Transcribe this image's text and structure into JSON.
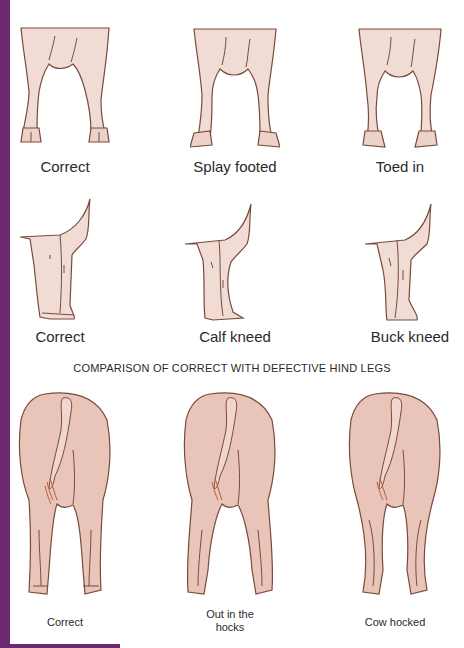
{
  "colors": {
    "accent_bar": "#6b2a70",
    "skin": "#f0dcd4",
    "rump": "#e9c5b9",
    "outline": "#7a4a3a"
  },
  "front_legs_front_view": [
    {
      "label": "Correct"
    },
    {
      "label": "Splay footed"
    },
    {
      "label": "Toed in"
    }
  ],
  "front_legs_side_view": [
    {
      "label": "Correct"
    },
    {
      "label": "Calf kneed"
    },
    {
      "label": "Buck kneed"
    }
  ],
  "hind_legs": {
    "title": "COMPARISON OF CORRECT WITH DEFECTIVE HIND LEGS",
    "items": [
      {
        "label": "Correct"
      },
      {
        "label_line1": "Out in the",
        "label_line2": "hocks"
      },
      {
        "label": "Cow hocked"
      }
    ]
  }
}
